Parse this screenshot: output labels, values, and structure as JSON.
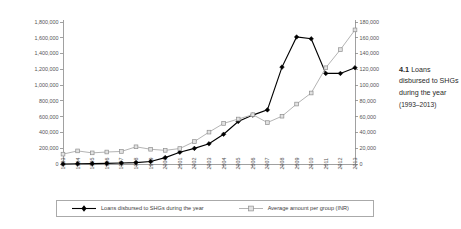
{
  "caption": {
    "number": "4.1",
    "text": "Loans disbursed to SHGs during the year",
    "range": "(1993–2013)"
  },
  "legend": {
    "items": [
      {
        "label": "Loans disbursed to SHGs during the year",
        "marker": "filled-diamond",
        "color": "#000000"
      },
      {
        "label": "Average amount per group (INR)",
        "marker": "hollow-square",
        "color": "#b4b4b4"
      }
    ]
  },
  "axes": {
    "left_ticks": [
      "0",
      "200,000",
      "400,000",
      "600,000",
      "800,000",
      "1,000,000",
      "1,200,000",
      "1,400,000",
      "1,600,000",
      "1,800,000"
    ],
    "right_ticks": [
      "0",
      "20,000",
      "40,000",
      "60,000",
      "80,000",
      "100,000",
      "120,000",
      "140,000",
      "160,000",
      "180,000"
    ]
  },
  "chart_data": {
    "type": "line",
    "title": "Loans disbursed to SHGs during the year (1993–2013)",
    "xlabel": "",
    "ylabel": "",
    "grid": false,
    "legend_position": "bottom",
    "categories": [
      "1993",
      "1994",
      "1995",
      "1996",
      "1997",
      "1998",
      "1999",
      "2000",
      "2001",
      "2002",
      "2003",
      "2004",
      "2005",
      "2006",
      "2007",
      "2008",
      "2009",
      "2010",
      "2011",
      "2012",
      "2013"
    ],
    "axes": {
      "left": {
        "label": "Loans disbursed to SHGs during the year",
        "range": [
          0,
          1800000
        ],
        "tick_step": 200000
      },
      "right": {
        "label": "Average amount per group (INR)",
        "range": [
          0,
          180000
        ],
        "tick_step": 20000
      }
    },
    "series": [
      {
        "name": "Loans disbursed to SHGs during the year",
        "axis": "left",
        "marker": "filled-diamond",
        "color": "#000000",
        "values": [
          620,
          3000,
          5000,
          8000,
          12000,
          18000,
          32000,
          81000,
          149000,
          198000,
          256000,
          377000,
          539000,
          620000,
          686000,
          1228000,
          1610000,
          1587000,
          1148000,
          1148000,
          1220000
        ]
      },
      {
        "name": "Average amount per group (INR)",
        "axis": "right",
        "marker": "hollow-square",
        "color": "#b4b4b4",
        "values": [
          12500,
          16600,
          14100,
          15200,
          15900,
          21800,
          18700,
          17300,
          19600,
          28500,
          40400,
          51400,
          57000,
          62500,
          52500,
          60600,
          76000,
          90000,
          122000,
          145000,
          170000
        ]
      }
    ]
  }
}
